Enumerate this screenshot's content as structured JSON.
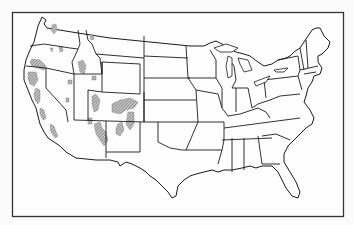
{
  "figure": {
    "type": "outline-map",
    "caption": "",
    "colors": {
      "background": "#fbfbfb",
      "outline": "#1a1a1a",
      "frame": "#333333",
      "shaded_region": "#8a8a8a"
    },
    "legend": [],
    "shaded_regions": [
      {
        "name": "cascade-range-washington",
        "state": "Washington"
      },
      {
        "name": "cascade-range-oregon",
        "state": "Oregon"
      },
      {
        "name": "blue-mountains-oregon",
        "state": "Oregon"
      },
      {
        "name": "klamath-mountains",
        "state": "California/Oregon"
      },
      {
        "name": "sierra-nevada",
        "state": "California"
      },
      {
        "name": "southern-california-ranges",
        "state": "California"
      },
      {
        "name": "idaho-mountains",
        "state": "Idaho"
      },
      {
        "name": "nevada-ranges",
        "state": "Nevada"
      },
      {
        "name": "wasatch-uinta",
        "state": "Utah"
      },
      {
        "name": "colorado-rockies",
        "state": "Colorado"
      },
      {
        "name": "sangre-de-cristo",
        "state": "New Mexico"
      },
      {
        "name": "mogollon-rim",
        "state": "Arizona/New Mexico"
      }
    ],
    "labels": []
  }
}
